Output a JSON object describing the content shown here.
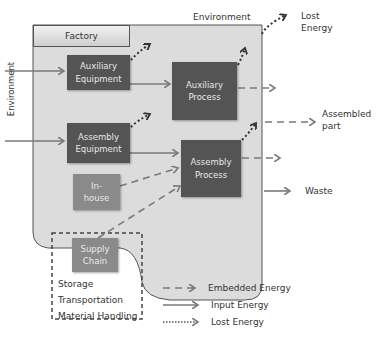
{
  "environment_top": "Environment",
  "environment_left": "Environment",
  "factory_label": "Factory",
  "boxes": {
    "auxiliary_equipment": [
      "Auxiliary",
      "Equipment"
    ],
    "auxiliary_process": [
      "Auxiliary",
      "Process"
    ],
    "assembly_equipment": [
      "Assembly",
      "Equipment"
    ],
    "assembly_process": [
      "Assembly",
      "Process"
    ],
    "in_house": [
      "In-",
      "house"
    ],
    "supply_chain": [
      "Supply",
      "Chain"
    ]
  },
  "outputs": {
    "lost_energy": [
      "Lost",
      "Energy"
    ],
    "assembled_part": [
      "Assembled",
      "part"
    ],
    "waste": "Waste"
  },
  "supply_chain_items": [
    "Storage",
    "Transportation",
    "Material Handling"
  ],
  "legend": {
    "embedded": "Embedded Energy",
    "input": "Input Energy",
    "lost": "Lost Energy"
  },
  "colors": {
    "process_box": "#545454",
    "source_box": "#8a8a8a",
    "factory_fill": "#d9d9d9",
    "arrow": "#7a7a7a"
  }
}
